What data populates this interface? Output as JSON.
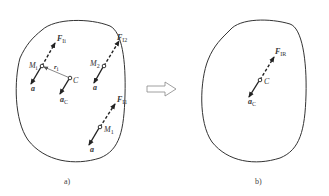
{
  "panels": {
    "a": {
      "caption": "a)",
      "labels": {
        "F_i": "F",
        "F_i_sub": "Ii",
        "F_12": "F",
        "F_12_sub": "I2",
        "F_11": "F",
        "F_11_sub": "I1",
        "M_i": "M",
        "M_i_sub": "i",
        "M_2": "M",
        "M_2_sub": "2",
        "M_1": "M",
        "M_1_sub": "1",
        "r_i": "r",
        "r_i_sub": "i",
        "C": "C",
        "a_C": "a",
        "a_C_sub": "C",
        "a": "a"
      }
    },
    "b": {
      "caption": "b)",
      "labels": {
        "F_IR": "F",
        "F_IR_sub": "IR",
        "C": "C",
        "a_C": "a",
        "a_C_sub": "C"
      }
    }
  },
  "transition_arrow": "hollow-right-arrow"
}
